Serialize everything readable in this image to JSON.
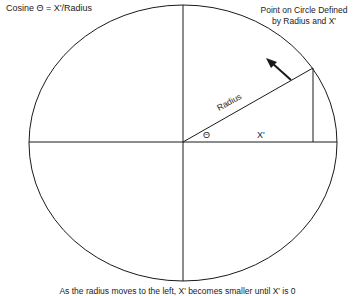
{
  "diagram": {
    "title": "Cosine Θ =  X'/Radius",
    "annotation": "Point on Circle Defined by Radius and X'",
    "caption": "As the radius moves to the left, X' becomes smaller until X' is 0",
    "labels": {
      "radius": "Radius",
      "theta": "Θ",
      "x_prime": "X'"
    },
    "geometry": {
      "center": [
        183,
        142
      ],
      "rx": 154,
      "ry": 138,
      "point_on_circle": [
        313,
        68
      ],
      "arrow_from": [
        291,
        80
      ],
      "arrow_to": [
        268,
        60
      ]
    },
    "colors": {
      "stroke": "#1a1a1a",
      "background": "#ffffff"
    }
  }
}
